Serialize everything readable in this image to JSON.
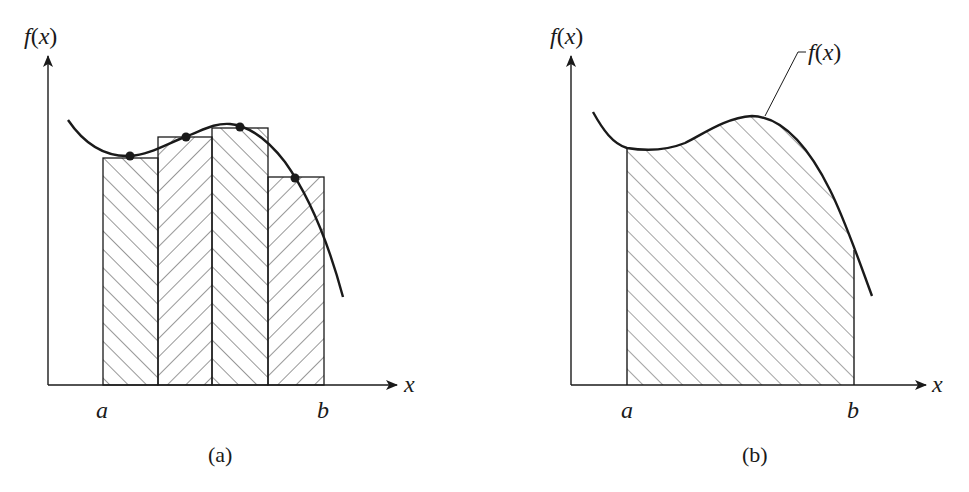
{
  "figure": {
    "stroke_color": "#1a1a1a",
    "background": "#ffffff"
  },
  "panel_a": {
    "caption": "(a)",
    "y_axis_label": "f(x)",
    "x_axis_label": "x",
    "lower_bound_label": "a",
    "upper_bound_label": "b",
    "rectangle_count": 4,
    "sample_point_count": 4
  },
  "panel_b": {
    "caption": "(b)",
    "y_axis_label": "f(x)",
    "x_axis_label": "x",
    "lower_bound_label": "a",
    "upper_bound_label": "b",
    "curve_callout_label": "f(x)"
  },
  "chart_data": [
    {
      "type": "area",
      "title": "(a)",
      "xlabel": "x",
      "ylabel": "f(x)",
      "x_ticks": [
        "a",
        "b"
      ],
      "grid": false,
      "description": "Curve f(x) approximated by 4 rectangles between a and b; rectangle heights taken at sample points marked with dots",
      "rectangles": [
        {
          "index": 1,
          "hatch": "forward-diagonal",
          "relative_height": 0.7
        },
        {
          "index": 2,
          "hatch": "backward-diagonal",
          "relative_height": 0.76
        },
        {
          "index": 3,
          "hatch": "forward-diagonal",
          "relative_height": 0.79
        },
        {
          "index": 4,
          "hatch": "backward-diagonal",
          "relative_height": 0.64
        }
      ]
    },
    {
      "type": "area",
      "title": "(b)",
      "xlabel": "x",
      "ylabel": "f(x)",
      "x_ticks": [
        "a",
        "b"
      ],
      "grid": false,
      "description": "Exact area under curve f(x) from a to b, shaded with diagonal hatching"
    }
  ]
}
